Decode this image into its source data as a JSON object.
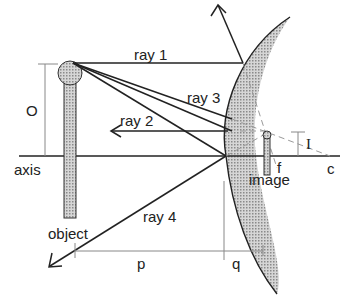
{
  "diagram": {
    "type": "convex mirror ray diagram",
    "labels": {
      "ray1": "ray 1",
      "ray2": "ray 2",
      "ray3": "ray 3",
      "ray4": "ray 4",
      "object_height": "O",
      "image_height": "I",
      "axis": "axis",
      "object": "object",
      "image": "image",
      "focal_point": "f",
      "center": "c",
      "object_distance": "p",
      "image_distance": "q"
    },
    "colors": {
      "line": "#222222",
      "mirror_fill": "#bdbdbd",
      "object_fill": "#b5b5b5",
      "dashed": "#9a9a9a",
      "dimension": "#888888"
    }
  }
}
